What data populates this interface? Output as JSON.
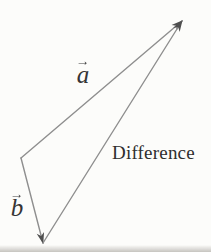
{
  "figure": {
    "background": "#fcfcfa",
    "line_color": "#8e8e8e",
    "arrow_color": "#4f4f4f",
    "text_color": "#2e2e2e",
    "points": {
      "origin": {
        "x": 21,
        "y": 158
      },
      "tip_top": {
        "x": 182,
        "y": 21
      },
      "tip_bottom": {
        "x": 43,
        "y": 243
      }
    },
    "edges": [
      {
        "name": "vector-a",
        "from": "origin",
        "to": "tip_top"
      },
      {
        "name": "vector-b",
        "from": "origin",
        "to": "tip_bottom"
      },
      {
        "name": "difference-vector",
        "from": "tip_bottom",
        "to": "tip_top"
      }
    ],
    "labels": {
      "a": {
        "letter": "a",
        "arrow": "→"
      },
      "b": {
        "letter": "b",
        "arrow": "→"
      },
      "difference": {
        "text": "Difference"
      }
    }
  }
}
